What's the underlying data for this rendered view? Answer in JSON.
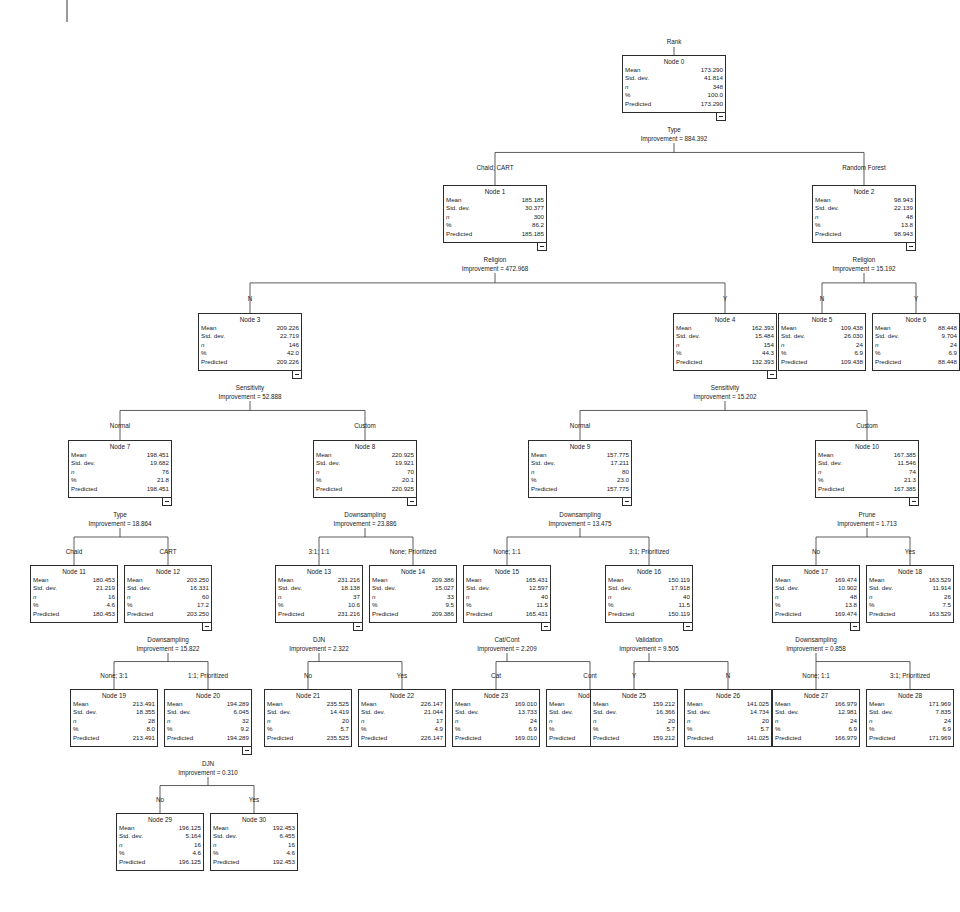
{
  "diagram": {
    "type": "decision-tree",
    "root_variable": "Rank",
    "field_labels": {
      "mean": "Mean",
      "std_dev": "Std. dev.",
      "n": "n",
      "percent": "%",
      "predicted": "Predicted"
    },
    "improvement_prefix": "Improvement = "
  },
  "nodes": [
    {
      "id": "n0",
      "title": "Node 0",
      "mean": "173.290",
      "std_dev": "41.814",
      "n": "348",
      "percent": "100.0",
      "predicted": "173.290",
      "split_variable": "Type",
      "improvement": "884.392",
      "edge_label": "",
      "x": 622,
      "y": 55,
      "w": 104,
      "h": 58,
      "split_x": 674,
      "split_y": 126,
      "has_collapse": true
    },
    {
      "id": "n1",
      "title": "Node 1",
      "mean": "185.185",
      "std_dev": "30.377",
      "n": "300",
      "percent": "86.2",
      "predicted": "185.185",
      "split_variable": "Religion",
      "improvement": "472.968",
      "edge_label": "Chaid; CART",
      "x": 443,
      "y": 185,
      "w": 104,
      "h": 58,
      "split_x": 495,
      "split_y": 256,
      "edge_x": 495,
      "edge_y": 164,
      "has_collapse": true
    },
    {
      "id": "n2",
      "title": "Node 2",
      "mean": "98.943",
      "std_dev": "22.139",
      "n": "48",
      "percent": "13.8",
      "predicted": "98.943",
      "split_variable": "Religion",
      "improvement": "15.192",
      "edge_label": "Random Forest",
      "x": 812,
      "y": 185,
      "w": 104,
      "h": 58,
      "split_x": 864,
      "split_y": 256,
      "edge_x": 864,
      "edge_y": 164,
      "has_collapse": true
    },
    {
      "id": "n3",
      "title": "Node 3",
      "mean": "209.226",
      "std_dev": "22.719",
      "n": "146",
      "percent": "42.0",
      "predicted": "209.226",
      "split_variable": "Sensitivity",
      "improvement": "52.888",
      "edge_label": "N",
      "x": 198,
      "y": 313,
      "w": 104,
      "h": 58,
      "split_x": 250,
      "split_y": 384,
      "edge_x": 250,
      "edge_y": 295,
      "has_collapse": true
    },
    {
      "id": "n4",
      "title": "Node 4",
      "mean": "162.393",
      "std_dev": "15.484",
      "n": "154",
      "percent": "44.3",
      "predicted": "132.393",
      "split_variable": "Sensitivity",
      "improvement": "15.202",
      "edge_label": "Y",
      "x": 673,
      "y": 313,
      "w": 104,
      "h": 58,
      "split_x": 725,
      "split_y": 384,
      "edge_x": 725,
      "edge_y": 295,
      "has_collapse": true
    },
    {
      "id": "n5",
      "title": "Node 5",
      "mean": "109.438",
      "std_dev": "26.030",
      "n": "24",
      "percent": "6.9",
      "predicted": "109.438",
      "split_variable": "",
      "improvement": "",
      "edge_label": "N",
      "x": 778,
      "y": 313,
      "w": 88,
      "h": 58,
      "edge_x": 822,
      "edge_y": 295,
      "has_collapse": false
    },
    {
      "id": "n6",
      "title": "Node 6",
      "mean": "88.448",
      "std_dev": "9.704",
      "n": "24",
      "percent": "6.9",
      "predicted": "88.448",
      "split_variable": "",
      "improvement": "",
      "edge_label": "Y",
      "x": 872,
      "y": 313,
      "w": 88,
      "h": 58,
      "edge_x": 916,
      "edge_y": 295,
      "has_collapse": false
    },
    {
      "id": "n7",
      "title": "Node 7",
      "mean": "198.451",
      "std_dev": "19.682",
      "n": "76",
      "percent": "21.8",
      "predicted": "198.451",
      "split_variable": "Type",
      "improvement": "18.864",
      "edge_label": "Normal",
      "x": 68,
      "y": 440,
      "w": 104,
      "h": 58,
      "split_x": 120,
      "split_y": 511,
      "edge_x": 120,
      "edge_y": 422,
      "has_collapse": true
    },
    {
      "id": "n8",
      "title": "Node 8",
      "mean": "220.925",
      "std_dev": "19.921",
      "n": "70",
      "percent": "20.1",
      "predicted": "220.925",
      "split_variable": "Downsampling",
      "improvement": "23.886",
      "edge_label": "Custom",
      "x": 313,
      "y": 440,
      "w": 104,
      "h": 58,
      "split_x": 365,
      "split_y": 511,
      "edge_x": 365,
      "edge_y": 422,
      "has_collapse": true
    },
    {
      "id": "n9",
      "title": "Node 9",
      "mean": "157.775",
      "std_dev": "17.211",
      "n": "80",
      "percent": "23.0",
      "predicted": "157.775",
      "split_variable": "Downsampling",
      "improvement": "13.475",
      "edge_label": "Normal",
      "x": 528,
      "y": 440,
      "w": 104,
      "h": 58,
      "split_x": 580,
      "split_y": 511,
      "edge_x": 580,
      "edge_y": 422,
      "has_collapse": true
    },
    {
      "id": "n10",
      "title": "Node 10",
      "mean": "167.385",
      "std_dev": "11.546",
      "n": "74",
      "percent": "21.3",
      "predicted": "167.385",
      "split_variable": "Prune",
      "improvement": "1.713",
      "edge_label": "Custom",
      "x": 815,
      "y": 440,
      "w": 104,
      "h": 58,
      "split_x": 867,
      "split_y": 511,
      "edge_x": 867,
      "edge_y": 422,
      "has_collapse": true
    },
    {
      "id": "n11",
      "title": "Node 11",
      "mean": "180.453",
      "std_dev": "21.219",
      "n": "16",
      "percent": "4.6",
      "predicted": "180.453",
      "split_variable": "",
      "improvement": "",
      "edge_label": "Chaid",
      "x": 30,
      "y": 565,
      "w": 88,
      "h": 58,
      "edge_x": 74,
      "edge_y": 548,
      "has_collapse": false
    },
    {
      "id": "n12",
      "title": "Node 12",
      "mean": "203.250",
      "std_dev": "16.331",
      "n": "60",
      "percent": "17.2",
      "predicted": "203.250",
      "split_variable": "Downsampling",
      "improvement": "15.822",
      "edge_label": "CART",
      "x": 124,
      "y": 565,
      "w": 88,
      "h": 58,
      "split_x": 168,
      "split_y": 636,
      "edge_x": 168,
      "edge_y": 548,
      "has_collapse": true
    },
    {
      "id": "n13",
      "title": "Node 13",
      "mean": "231.216",
      "std_dev": "18.138",
      "n": "37",
      "percent": "10.6",
      "predicted": "231.216",
      "split_variable": "DJN",
      "improvement": "2.322",
      "edge_label": "3:1; 1:1",
      "x": 275,
      "y": 565,
      "w": 88,
      "h": 58,
      "split_x": 319,
      "split_y": 636,
      "edge_x": 319,
      "edge_y": 548,
      "has_collapse": true
    },
    {
      "id": "n14",
      "title": "Node 14",
      "mean": "209.386",
      "std_dev": "15.027",
      "n": "33",
      "percent": "9.5",
      "predicted": "209.386",
      "split_variable": "",
      "improvement": "",
      "edge_label": "None; Prioritized",
      "x": 369,
      "y": 565,
      "w": 88,
      "h": 58,
      "edge_x": 413,
      "edge_y": 548,
      "has_collapse": false
    },
    {
      "id": "n15",
      "title": "Node 15",
      "mean": "165.431",
      "std_dev": "12.597",
      "n": "40",
      "percent": "11.5",
      "predicted": "165.431",
      "split_variable": "Cat/Cont",
      "improvement": "2.209",
      "edge_label": "None; 1:1",
      "x": 463,
      "y": 565,
      "w": 88,
      "h": 58,
      "split_x": 507,
      "split_y": 636,
      "edge_x": 507,
      "edge_y": 548,
      "has_collapse": true
    },
    {
      "id": "n16",
      "title": "Node 16",
      "mean": "150.119",
      "std_dev": "17.918",
      "n": "40",
      "percent": "11.5",
      "predicted": "150.119",
      "split_variable": "Validation",
      "improvement": "9.505",
      "edge_label": "3:1; Prioritized",
      "x": 605,
      "y": 565,
      "w": 88,
      "h": 58,
      "split_x": 649,
      "split_y": 636,
      "edge_x": 649,
      "edge_y": 548,
      "has_collapse": true
    },
    {
      "id": "n17",
      "title": "Node 17",
      "mean": "169.474",
      "std_dev": "10.902",
      "n": "48",
      "percent": "13.8",
      "predicted": "169.474",
      "split_variable": "Downsampling",
      "improvement": "0.858",
      "edge_label": "No",
      "x": 772,
      "y": 565,
      "w": 88,
      "h": 58,
      "split_x": 816,
      "split_y": 636,
      "edge_x": 816,
      "edge_y": 548,
      "has_collapse": true
    },
    {
      "id": "n18",
      "title": "Node 18",
      "mean": "163.529",
      "std_dev": "11.914",
      "n": "26",
      "percent": "7.5",
      "predicted": "163.529",
      "split_variable": "",
      "improvement": "",
      "edge_label": "Yes",
      "x": 866,
      "y": 565,
      "w": 88,
      "h": 58,
      "edge_x": 910,
      "edge_y": 548,
      "has_collapse": false
    },
    {
      "id": "n19",
      "title": "Node 19",
      "mean": "213.491",
      "std_dev": "18.355",
      "n": "28",
      "percent": "8.0",
      "predicted": "213.491",
      "split_variable": "",
      "improvement": "",
      "edge_label": "None; 3:1",
      "x": 70,
      "y": 689,
      "w": 88,
      "h": 58,
      "edge_x": 114,
      "edge_y": 672,
      "has_collapse": false
    },
    {
      "id": "n20",
      "title": "Node 20",
      "mean": "194.289",
      "std_dev": "6.045",
      "n": "32",
      "percent": "9.2",
      "predicted": "194.289",
      "split_variable": "DJN",
      "improvement": "0.310",
      "edge_label": "1:1; Prioritized",
      "x": 164,
      "y": 689,
      "w": 88,
      "h": 58,
      "split_x": 208,
      "split_y": 760,
      "edge_x": 208,
      "edge_y": 672,
      "has_collapse": true
    },
    {
      "id": "n21",
      "title": "Node 21",
      "mean": "235.525",
      "std_dev": "14.419",
      "n": "20",
      "percent": "5.7",
      "predicted": "235.525",
      "split_variable": "",
      "improvement": "",
      "edge_label": "No",
      "x": 264,
      "y": 689,
      "w": 88,
      "h": 58,
      "edge_x": 308,
      "edge_y": 672,
      "has_collapse": false
    },
    {
      "id": "n22",
      "title": "Node 22",
      "mean": "226.147",
      "std_dev": "21.044",
      "n": "17",
      "percent": "4.9",
      "predicted": "226.147",
      "split_variable": "",
      "improvement": "",
      "edge_label": "Yes",
      "x": 358,
      "y": 689,
      "w": 88,
      "h": 58,
      "edge_x": 402,
      "edge_y": 672,
      "has_collapse": false
    },
    {
      "id": "n23",
      "title": "Node 23",
      "mean": "169.010",
      "std_dev": "13.733",
      "n": "24",
      "percent": "6.9",
      "predicted": "169.010",
      "split_variable": "",
      "improvement": "",
      "edge_label": "Cat",
      "x": 452,
      "y": 689,
      "w": 88,
      "h": 58,
      "edge_x": 496,
      "edge_y": 672,
      "has_collapse": false
    },
    {
      "id": "n24",
      "title": "Node 24",
      "mean": "160.062",
      "std_dev": "8.497",
      "n": "16",
      "percent": "4.6",
      "predicted": "160.062",
      "split_variable": "",
      "improvement": "",
      "edge_label": "Cont",
      "x": 546,
      "y": 689,
      "w": 88,
      "h": 58,
      "edge_x": 590,
      "edge_y": 672,
      "has_collapse": false
    },
    {
      "id": "n25",
      "title": "Node 25",
      "mean": "159.212",
      "std_dev": "16.366",
      "n": "20",
      "percent": "5.7",
      "predicted": "159.212",
      "split_variable": "",
      "improvement": "",
      "edge_label": "Y",
      "x": 590,
      "y": 689,
      "w": 88,
      "h": 58,
      "edge_x": 634,
      "edge_y": 672,
      "has_collapse": false
    },
    {
      "id": "n26",
      "title": "Node 26",
      "mean": "141.025",
      "std_dev": "14.734",
      "n": "20",
      "percent": "5.7",
      "predicted": "141.025",
      "split_variable": "",
      "improvement": "",
      "edge_label": "N",
      "x": 684,
      "y": 689,
      "w": 88,
      "h": 58,
      "edge_x": 728,
      "edge_y": 672,
      "has_collapse": false
    },
    {
      "id": "n27",
      "title": "Node 27",
      "mean": "166.979",
      "std_dev": "12.981",
      "n": "24",
      "percent": "6.9",
      "predicted": "166.979",
      "split_variable": "",
      "improvement": "",
      "edge_label": "None; 1:1",
      "x": 772,
      "y": 689,
      "w": 88,
      "h": 58,
      "edge_x": 816,
      "edge_y": 672,
      "has_collapse": false
    },
    {
      "id": "n28",
      "title": "Node 28",
      "mean": "171.969",
      "std_dev": "7.835",
      "n": "24",
      "percent": "6.9",
      "predicted": "171.969",
      "split_variable": "",
      "improvement": "",
      "edge_label": "3:1; Prioritized",
      "x": 866,
      "y": 689,
      "w": 88,
      "h": 58,
      "edge_x": 910,
      "edge_y": 672,
      "has_collapse": false
    },
    {
      "id": "n29",
      "title": "Node 29",
      "mean": "196.125",
      "std_dev": "5.164",
      "n": "16",
      "percent": "4.6",
      "predicted": "196.125",
      "split_variable": "",
      "improvement": "",
      "edge_label": "No",
      "x": 116,
      "y": 813,
      "w": 88,
      "h": 58,
      "edge_x": 160,
      "edge_y": 796,
      "has_collapse": false
    },
    {
      "id": "n30",
      "title": "Node 30",
      "mean": "192.453",
      "std_dev": "6.455",
      "n": "16",
      "percent": "4.6",
      "predicted": "192.453",
      "split_variable": "",
      "improvement": "",
      "edge_label": "Yes",
      "x": 210,
      "y": 813,
      "w": 88,
      "h": 58,
      "edge_x": 254,
      "edge_y": 796,
      "has_collapse": false
    }
  ],
  "edges": [
    {
      "from": "n0",
      "to": "n1"
    },
    {
      "from": "n0",
      "to": "n2"
    },
    {
      "from": "n1",
      "to": "n3"
    },
    {
      "from": "n1",
      "to": "n4"
    },
    {
      "from": "n2",
      "to": "n5"
    },
    {
      "from": "n2",
      "to": "n6"
    },
    {
      "from": "n3",
      "to": "n7"
    },
    {
      "from": "n3",
      "to": "n8"
    },
    {
      "from": "n4",
      "to": "n9"
    },
    {
      "from": "n4",
      "to": "n10"
    },
    {
      "from": "n7",
      "to": "n11"
    },
    {
      "from": "n7",
      "to": "n12"
    },
    {
      "from": "n8",
      "to": "n13"
    },
    {
      "from": "n8",
      "to": "n14"
    },
    {
      "from": "n9",
      "to": "n15"
    },
    {
      "from": "n9",
      "to": "n16"
    },
    {
      "from": "n10",
      "to": "n17"
    },
    {
      "from": "n10",
      "to": "n18"
    },
    {
      "from": "n12",
      "to": "n19"
    },
    {
      "from": "n12",
      "to": "n20"
    },
    {
      "from": "n13",
      "to": "n21"
    },
    {
      "from": "n13",
      "to": "n22"
    },
    {
      "from": "n15",
      "to": "n23"
    },
    {
      "from": "n15",
      "to": "n24"
    },
    {
      "from": "n16",
      "to": "n25"
    },
    {
      "from": "n16",
      "to": "n26"
    },
    {
      "from": "n17",
      "to": "n27"
    },
    {
      "from": "n17",
      "to": "n28"
    },
    {
      "from": "n20",
      "to": "n29"
    },
    {
      "from": "n20",
      "to": "n30"
    }
  ],
  "root_title": "Rank"
}
